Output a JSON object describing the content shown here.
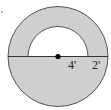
{
  "diagram": {
    "type": "geometry-figure",
    "colors": {
      "fill": "#cfcfcf",
      "stroke": "#444444",
      "background": "#ffffff",
      "point": "#000000"
    },
    "labels": {
      "inner_radius": "4'",
      "ring_width": "2'"
    },
    "dimensions": {
      "inner_radius_ft": 4,
      "ring_width_ft": 2,
      "outer_radius_ft": 6
    }
  }
}
